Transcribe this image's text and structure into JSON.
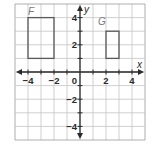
{
  "diagram": {
    "type": "coordinate-plane",
    "x_axis_label": "x",
    "y_axis_label": "y",
    "origin_label": "0",
    "x_range": [
      -5,
      5
    ],
    "y_range": [
      -5,
      5
    ],
    "grid_step": 1,
    "x_tick_labels": [
      {
        "value": -4,
        "text": "−4"
      },
      {
        "value": -2,
        "text": "−2"
      },
      {
        "value": 2,
        "text": "2"
      },
      {
        "value": 4,
        "text": "4"
      }
    ],
    "y_tick_labels": [
      {
        "value": 4,
        "text": "4"
      },
      {
        "value": 2,
        "text": "2"
      },
      {
        "value": -2,
        "text": "−2"
      },
      {
        "value": -4,
        "text": "−4"
      }
    ],
    "shapes": [
      {
        "name": "F",
        "label": "F",
        "x_min": -4,
        "x_max": -2,
        "y_min": 1,
        "y_max": 4
      },
      {
        "name": "G",
        "label": "G",
        "x_min": 2,
        "x_max": 3,
        "y_min": 1,
        "y_max": 3
      }
    ],
    "colors": {
      "grid": "#c4c4c4",
      "border": "#9a9a9a",
      "axis": "#2a2a2a",
      "shape_stroke": "#5a5a5a",
      "shape_label": "#7a7a7a",
      "tick_text": "#2a2a2a"
    }
  }
}
